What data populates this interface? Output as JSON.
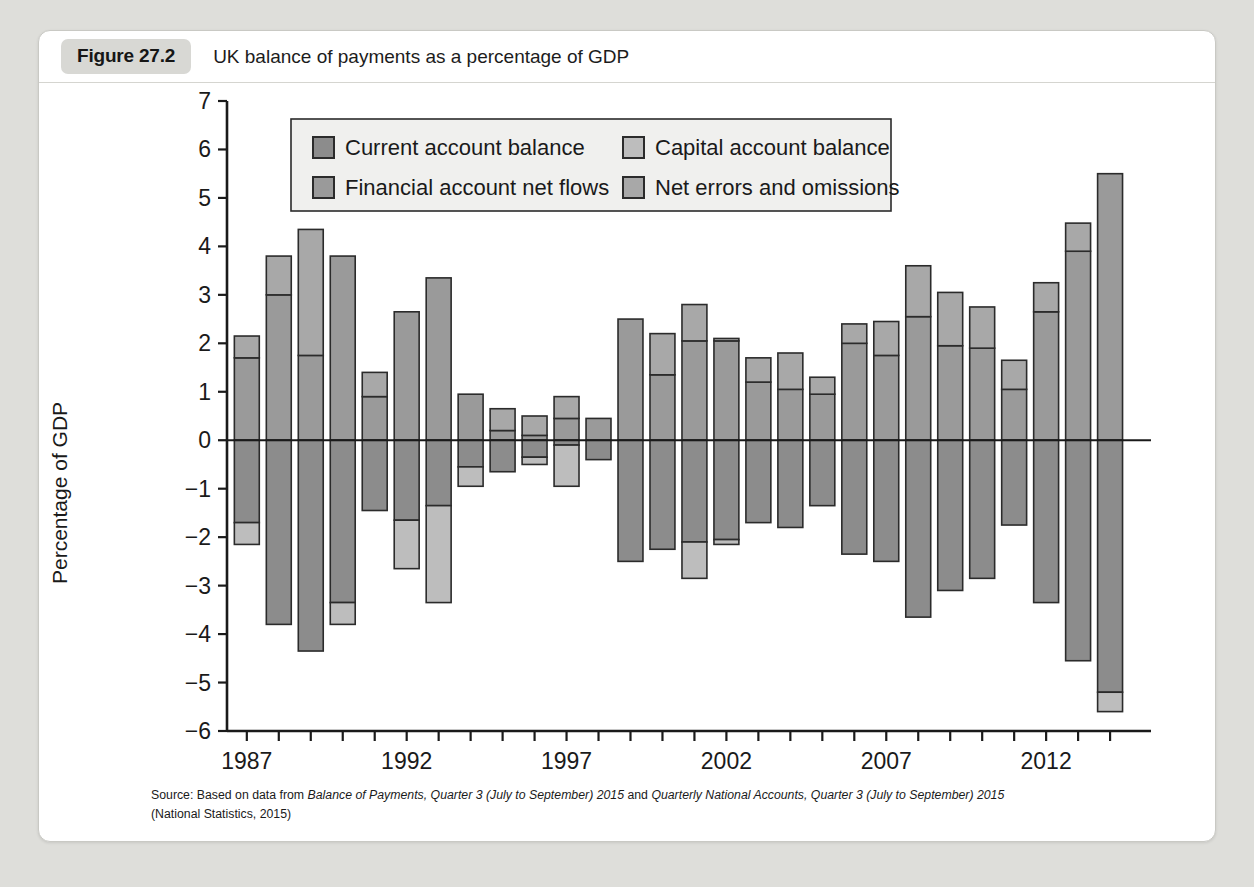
{
  "figure": {
    "badge": "Figure 27.2",
    "title": "UK balance of payments as a percentage of GDP",
    "source_line_1_prefix": "Source: Based on data from ",
    "source_italic_1": "Balance of Payments, Quarter 3 (July to September) 2015",
    "source_mid": " and ",
    "source_italic_2": "Quarterly National Accounts, Quarter 3 (July to September) 2015",
    "source_line_2": "(National Statistics, 2015)"
  },
  "colors": {
    "current_account": "#8c8c8c",
    "capital_account": "#bdbdbd",
    "financial_account": "#9a9a9a",
    "net_errors": "#a8a8a8",
    "outline": "#2b2b2b",
    "axis": "#1a1a1a",
    "card": "#ffffff",
    "page_background": "#dededa",
    "badge_background": "#d8d8d4"
  },
  "chart_data": {
    "type": "bar",
    "subtype": "stacked-diverging",
    "title": "UK balance of payments as a percentage of GDP",
    "xlabel": "",
    "ylabel": "Percentage of GDP",
    "ylim": [
      -6,
      7
    ],
    "ytick_step": 1,
    "yticks": [
      7,
      6,
      5,
      4,
      3,
      2,
      1,
      0,
      -1,
      -2,
      -3,
      -4,
      -5,
      -6
    ],
    "ytick_labels": [
      "7",
      "6",
      "5",
      "4",
      "3",
      "2",
      "1",
      "0",
      "−1",
      "−2",
      "−3",
      "−4",
      "−5",
      "−6"
    ],
    "grid": false,
    "legend_position": "top-center-inside",
    "x": [
      1987,
      1988,
      1989,
      1990,
      1991,
      1992,
      1993,
      1994,
      1995,
      1996,
      1997,
      1998,
      1999,
      2000,
      2001,
      2002,
      2003,
      2004,
      2005,
      2006,
      2007,
      2008,
      2009,
      2010,
      2011,
      2012,
      2013,
      2014
    ],
    "xtick_labels_shown": [
      "1987",
      "1992",
      "1997",
      "2002",
      "2007",
      "2012"
    ],
    "xtick_label_years": [
      1987,
      1992,
      1997,
      2002,
      2007,
      2012
    ],
    "series": [
      {
        "name": "Current account balance",
        "key": "current_account",
        "color": "#8c8c8c",
        "values": [
          -1.7,
          -3.8,
          -4.35,
          -3.35,
          -1.45,
          -1.65,
          -1.35,
          -0.55,
          -0.65,
          -0.35,
          -0.1,
          -0.4,
          -2.5,
          -2.25,
          -2.1,
          -1.7,
          -1.3,
          -1.8,
          -1.35,
          -2.35,
          -2.5,
          -3.65,
          -3.1,
          -2.85,
          -1.75,
          -3.35,
          -4.55,
          -5.2
        ]
      },
      {
        "name": "Capital account balance",
        "key": "capital_account",
        "color": "#bdbdbd",
        "values": [
          -0.45,
          0.0,
          0.0,
          -0.4,
          0.0,
          0.0,
          0.0,
          0.0,
          0.05,
          0.05,
          0.05,
          0.05,
          0.05,
          0.05,
          -0.7,
          -0.1,
          0.05,
          0.05,
          0.05,
          0.05,
          0.05,
          0.05,
          0.05,
          0.05,
          0.05,
          0.05,
          0.05,
          -0.35
        ]
      },
      {
        "name": "Financial account net flows",
        "key": "financial_account",
        "color": "#9a9a9a",
        "values": [
          1.7,
          3.0,
          1.75,
          3.8,
          0.9,
          2.65,
          3.35,
          0.95,
          0.2,
          0.1,
          0.05,
          0.45,
          2.5,
          1.35,
          2.05,
          1.2,
          1.05,
          0.95,
          2.0,
          1.75,
          2.55,
          1.95,
          1.9,
          1.05,
          2.65,
          3.9,
          5.5,
          5.5
        ]
      },
      {
        "name": "Net errors and omissions",
        "key": "net_errors",
        "color": "#a8a8a8",
        "values": [
          0.45,
          0.8,
          2.6,
          0.0,
          0.5,
          0.0,
          0.0,
          0.0,
          0.45,
          0.4,
          0.45,
          0.45,
          0.0,
          0.85,
          0.75,
          0.85,
          0.65,
          0.85,
          0.4,
          0.7,
          1.05,
          1.1,
          0.85,
          0.6,
          0.6,
          0.6,
          0.0,
          0.0
        ]
      }
    ],
    "bars": [
      {
        "year": 1987,
        "pos": [
          {
            "key": "financial_account",
            "value": 1.7
          },
          {
            "key": "net_errors",
            "value": 0.45
          }
        ],
        "neg": [
          {
            "key": "current_account",
            "value": -1.7
          },
          {
            "key": "capital_account",
            "value": -0.45
          }
        ],
        "top": 2.15,
        "bottom": -2.15
      },
      {
        "year": 1988,
        "pos": [
          {
            "key": "financial_account",
            "value": 3.0
          },
          {
            "key": "net_errors",
            "value": 0.8
          }
        ],
        "neg": [
          {
            "key": "current_account",
            "value": -3.8
          }
        ],
        "top": 3.8,
        "bottom": -3.8
      },
      {
        "year": 1989,
        "pos": [
          {
            "key": "financial_account",
            "value": 1.75
          },
          {
            "key": "net_errors",
            "value": 2.6
          }
        ],
        "neg": [
          {
            "key": "current_account",
            "value": -4.35
          }
        ],
        "top": 4.35,
        "bottom": -4.35
      },
      {
        "year": 1990,
        "pos": [
          {
            "key": "financial_account",
            "value": 3.8
          }
        ],
        "neg": [
          {
            "key": "current_account",
            "value": -3.35
          },
          {
            "key": "capital_account",
            "value": -0.45
          }
        ],
        "top": 3.8,
        "bottom": -3.8
      },
      {
        "year": 1991,
        "pos": [
          {
            "key": "financial_account",
            "value": 0.9
          },
          {
            "key": "net_errors",
            "value": 0.5
          }
        ],
        "neg": [
          {
            "key": "current_account",
            "value": -1.45
          }
        ],
        "top": 1.4,
        "bottom": -1.45
      },
      {
        "year": 1992,
        "pos": [
          {
            "key": "financial_account",
            "value": 2.65
          }
        ],
        "neg": [
          {
            "key": "current_account",
            "value": -1.65
          },
          {
            "key": "capital_account",
            "value": -1.0
          }
        ],
        "top": 2.65,
        "bottom": -2.65
      },
      {
        "year": 1993,
        "pos": [
          {
            "key": "financial_account",
            "value": 3.35
          }
        ],
        "neg": [
          {
            "key": "current_account",
            "value": -1.35
          },
          {
            "key": "capital_account",
            "value": -2.0
          }
        ],
        "top": 3.35,
        "bottom": -3.35
      },
      {
        "year": 1994,
        "pos": [
          {
            "key": "financial_account",
            "value": 0.95
          }
        ],
        "neg": [
          {
            "key": "current_account",
            "value": -0.55
          },
          {
            "key": "capital_account",
            "value": -0.4
          }
        ],
        "top": 0.95,
        "bottom": -0.95
      },
      {
        "year": 1995,
        "pos": [
          {
            "key": "financial_account",
            "value": 0.2
          },
          {
            "key": "net_errors",
            "value": 0.45
          }
        ],
        "neg": [
          {
            "key": "current_account",
            "value": -0.65
          }
        ],
        "top": 0.67,
        "bottom": -0.65
      },
      {
        "year": 1996,
        "pos": [
          {
            "key": "financial_account",
            "value": 0.1
          },
          {
            "key": "net_errors",
            "value": 0.4
          }
        ],
        "neg": [
          {
            "key": "current_account",
            "value": -0.35
          },
          {
            "key": "capital_account",
            "value": -0.15
          }
        ],
        "top": 0.52,
        "bottom": -0.5
      },
      {
        "year": 1997,
        "pos": [
          {
            "key": "financial_account",
            "value": 0.45
          },
          {
            "key": "net_errors",
            "value": 0.45
          }
        ],
        "neg": [
          {
            "key": "current_account",
            "value": -0.1
          },
          {
            "key": "capital_account",
            "value": -0.85
          }
        ],
        "top": 0.88,
        "bottom": -0.95
      },
      {
        "year": 1998,
        "pos": [
          {
            "key": "financial_account",
            "value": 0.45
          }
        ],
        "neg": [
          {
            "key": "current_account",
            "value": -0.4
          }
        ],
        "top": 0.45,
        "bottom": -0.45
      },
      {
        "year": 1999,
        "pos": [
          {
            "key": "financial_account",
            "value": 2.5
          }
        ],
        "neg": [
          {
            "key": "current_account",
            "value": -2.5
          }
        ],
        "top": 2.52,
        "bottom": -2.5
      },
      {
        "year": 2000,
        "pos": [
          {
            "key": "financial_account",
            "value": 1.35
          },
          {
            "key": "net_errors",
            "value": 0.85
          }
        ],
        "neg": [
          {
            "key": "current_account",
            "value": -2.25
          }
        ],
        "top": 2.2,
        "bottom": -2.25
      },
      {
        "year": 2001,
        "pos": [
          {
            "key": "financial_account",
            "value": 2.05
          },
          {
            "key": "net_errors",
            "value": 0.75
          }
        ],
        "neg": [
          {
            "key": "current_account",
            "value": -2.1
          },
          {
            "key": "capital_account",
            "value": -0.75
          }
        ],
        "top": 2.82,
        "bottom": -2.85
      },
      {
        "year": 2002,
        "pos": [
          {
            "key": "financial_account",
            "value": 2.05
          },
          {
            "key": "net_errors",
            "value": 0.05
          }
        ],
        "neg": [
          {
            "key": "current_account",
            "value": -2.05
          },
          {
            "key": "capital_account",
            "value": -0.1
          }
        ],
        "top": 2.08,
        "bottom": -2.15
      },
      {
        "year": 2003,
        "pos": [
          {
            "key": "financial_account",
            "value": 1.2
          },
          {
            "key": "net_errors",
            "value": 0.5
          }
        ],
        "neg": [
          {
            "key": "current_account",
            "value": -1.7
          }
        ],
        "top": 1.68,
        "bottom": -1.7
      },
      {
        "year": 2004,
        "pos": [
          {
            "key": "financial_account",
            "value": 1.05
          },
          {
            "key": "net_errors",
            "value": 0.75
          }
        ],
        "neg": [
          {
            "key": "current_account",
            "value": -1.8
          }
        ],
        "top": 1.8,
        "bottom": -1.85
      },
      {
        "year": 2005,
        "pos": [
          {
            "key": "financial_account",
            "value": 0.95
          },
          {
            "key": "net_errors",
            "value": 0.35
          }
        ],
        "neg": [
          {
            "key": "current_account",
            "value": -1.35
          }
        ],
        "top": 1.28,
        "bottom": -1.35
      },
      {
        "year": 2006,
        "pos": [
          {
            "key": "financial_account",
            "value": 2.0
          },
          {
            "key": "net_errors",
            "value": 0.4
          }
        ],
        "neg": [
          {
            "key": "current_account",
            "value": -2.35
          }
        ],
        "top": 2.4,
        "bottom": -2.4
      },
      {
        "year": 2007,
        "pos": [
          {
            "key": "financial_account",
            "value": 1.75
          },
          {
            "key": "net_errors",
            "value": 0.7
          }
        ],
        "neg": [
          {
            "key": "current_account",
            "value": -2.5
          }
        ],
        "top": 2.47,
        "bottom": -2.52
      },
      {
        "year": 2008,
        "pos": [
          {
            "key": "financial_account",
            "value": 2.55
          },
          {
            "key": "net_errors",
            "value": 1.05
          }
        ],
        "neg": [
          {
            "key": "current_account",
            "value": -3.65
          }
        ],
        "top": 3.6,
        "bottom": -3.65
      },
      {
        "year": 2009,
        "pos": [
          {
            "key": "financial_account",
            "value": 1.95
          },
          {
            "key": "net_errors",
            "value": 1.1
          }
        ],
        "neg": [
          {
            "key": "current_account",
            "value": -3.1
          }
        ],
        "top": 3.03,
        "bottom": -3.1
      },
      {
        "year": 2010,
        "pos": [
          {
            "key": "financial_account",
            "value": 1.9
          },
          {
            "key": "net_errors",
            "value": 0.85
          }
        ],
        "neg": [
          {
            "key": "current_account",
            "value": -2.85
          }
        ],
        "top": 2.77,
        "bottom": -2.85
      },
      {
        "year": 2011,
        "pos": [
          {
            "key": "financial_account",
            "value": 1.05
          },
          {
            "key": "net_errors",
            "value": 0.6
          }
        ],
        "neg": [
          {
            "key": "current_account",
            "value": -1.75
          }
        ],
        "top": 1.65,
        "bottom": -1.78
      },
      {
        "year": 2012,
        "pos": [
          {
            "key": "financial_account",
            "value": 2.65
          },
          {
            "key": "net_errors",
            "value": 0.6
          }
        ],
        "neg": [
          {
            "key": "current_account",
            "value": -3.35
          }
        ],
        "top": 3.25,
        "bottom": -3.35
      },
      {
        "year": 2013,
        "pos": [
          {
            "key": "financial_account",
            "value": 3.9
          },
          {
            "key": "net_errors",
            "value": 0.58
          }
        ],
        "neg": [
          {
            "key": "current_account",
            "value": -4.55
          }
        ],
        "top": 4.48,
        "bottom": -4.62
      },
      {
        "year": 2014,
        "pos": [
          {
            "key": "financial_account",
            "value": 5.5
          }
        ],
        "neg": [
          {
            "key": "current_account",
            "value": -5.2
          },
          {
            "key": "capital_account",
            "value": -0.4
          }
        ],
        "top": 5.5,
        "bottom": -5.6
      }
    ],
    "legend": [
      {
        "label": "Current account balance",
        "key": "current_account",
        "color": "#8c8c8c"
      },
      {
        "label": "Capital account balance",
        "key": "capital_account",
        "color": "#bdbdbd"
      },
      {
        "label": "Financial account net flows",
        "key": "financial_account",
        "color": "#9a9a9a"
      },
      {
        "label": "Net errors and omissions",
        "key": "net_errors",
        "color": "#a8a8a8"
      }
    ]
  }
}
